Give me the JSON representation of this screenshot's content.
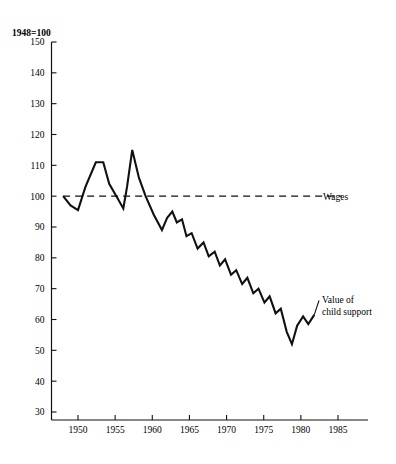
{
  "chart_data": {
    "type": "line",
    "title": "",
    "index_note": "1948=100",
    "xlabel": "",
    "ylabel": "",
    "xlim": [
      1948,
      1987
    ],
    "ylim": [
      30,
      150
    ],
    "ytick_step": 10,
    "grid": false,
    "legend_position": "inline-right-annotations",
    "ytick_labels": [
      "150",
      "140",
      "130",
      "120",
      "110",
      "100",
      "90",
      "80",
      "70",
      "60",
      "50",
      "40",
      "30"
    ],
    "ytick_values": [
      150,
      140,
      130,
      120,
      110,
      100,
      90,
      80,
      70,
      60,
      50,
      40,
      30
    ],
    "xtick_labels": [
      "1950",
      "1955",
      "1960",
      "1965",
      "1970",
      "1975",
      "1980",
      "1985"
    ],
    "xtick_values": [
      1950,
      1955,
      1960,
      1965,
      1970,
      1975,
      1980,
      1985
    ],
    "series": [
      {
        "name": "Wages",
        "label": "Wages",
        "style": "dashed",
        "color": "#000000",
        "constant_value": 100,
        "x_start": 1948,
        "x_end": 1985.5,
        "x": [
          1948,
          1985.5
        ],
        "values": [
          100,
          100
        ]
      },
      {
        "name": "Value of child support",
        "label_line_1": "Value of",
        "label_line_2": "child support",
        "style": "solid",
        "color": "#000000",
        "x": [
          1948,
          1949,
          1950,
          1951,
          1952.4,
          1953.4,
          1954.2,
          1955.4,
          1956.1,
          1956.6,
          1957.3,
          1958.2,
          1959.1,
          1960.2,
          1961.3,
          1962.0,
          1962.7,
          1963.3,
          1964.0,
          1964.6,
          1965.3,
          1966.1,
          1966.9,
          1967.6,
          1968.4,
          1969.1,
          1969.8,
          1970.6,
          1971.3,
          1972.1,
          1972.8,
          1973.6,
          1974.3,
          1975.1,
          1975.8,
          1976.6,
          1977.3,
          1978.1,
          1978.8,
          1979.5,
          1980.3,
          1981.0,
          1981.8
        ],
        "values": [
          100,
          97,
          95.5,
          103,
          111,
          111,
          104,
          99,
          96,
          103,
          115,
          106,
          100,
          94,
          89,
          93,
          95,
          91.5,
          92.5,
          87,
          88,
          83,
          85,
          80.5,
          82,
          77.5,
          79.5,
          74.5,
          76,
          71.5,
          73.5,
          68.5,
          70,
          65.5,
          67.5,
          62,
          63.5,
          56,
          52,
          58,
          61,
          58.5,
          61.5
        ]
      }
    ],
    "annotations": [
      {
        "text": "Wages",
        "x": 1986,
        "y": 100
      },
      {
        "text": "Value of child support",
        "x": 1983,
        "y": 63
      }
    ]
  },
  "labels": {
    "index_note": "1948=100",
    "wages": "Wages",
    "value_line_1": "Value of",
    "value_line_2": "child support"
  }
}
